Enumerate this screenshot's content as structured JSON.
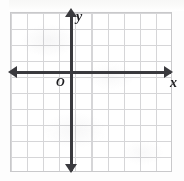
{
  "figure": {
    "kind": "coordinate-plane"
  },
  "labels": {
    "x_axis": "x",
    "y_axis": "y",
    "origin": "O"
  },
  "colors": {
    "axis": "#3a3a3e",
    "grid_line": "#d6d6d8",
    "grid_border": "#c9c9cb",
    "label": "#1d1d20",
    "background": "#fdfdfd"
  },
  "chart_data": {
    "type": "scatter",
    "title": "",
    "xlabel": "x",
    "ylabel": "y",
    "series": [],
    "x": [],
    "values": [],
    "xlim": [
      -4,
      6
    ],
    "ylim": [
      -6,
      4
    ],
    "grid": true,
    "grid_columns": 10,
    "grid_rows": 10,
    "grid_spacing_px": 16,
    "legend": "none",
    "annotations": [
      "O"
    ],
    "axis_arrows": [
      "left",
      "right",
      "up",
      "down"
    ],
    "origin_label": "O",
    "tick_labels": []
  }
}
